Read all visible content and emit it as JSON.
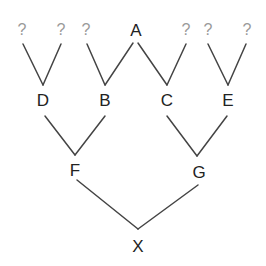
{
  "diagram": {
    "type": "genealogy-tree",
    "nodes": {
      "A": {
        "label": "A",
        "x": 136,
        "y": 36
      },
      "B": {
        "label": "B",
        "x": 105,
        "y": 106
      },
      "C": {
        "label": "C",
        "x": 167,
        "y": 106
      },
      "D": {
        "label": "D",
        "x": 43,
        "y": 106
      },
      "E": {
        "label": "E",
        "x": 228,
        "y": 106
      },
      "F": {
        "label": "F",
        "x": 75,
        "y": 176
      },
      "G": {
        "label": "G",
        "x": 199,
        "y": 178
      },
      "X": {
        "label": "X",
        "x": 138,
        "y": 252
      }
    },
    "unknowns": [
      {
        "label": "?",
        "x": 22,
        "y": 35
      },
      {
        "label": "?",
        "x": 61,
        "y": 35
      },
      {
        "label": "?",
        "x": 86,
        "y": 35
      },
      {
        "label": "?",
        "x": 186,
        "y": 35
      },
      {
        "label": "?",
        "x": 208,
        "y": 35
      },
      {
        "label": "?",
        "x": 247,
        "y": 35
      }
    ],
    "edges": [
      {
        "from": "?1",
        "to": "D"
      },
      {
        "from": "?2",
        "to": "D"
      },
      {
        "from": "?3",
        "to": "B"
      },
      {
        "from": "A",
        "to": "B"
      },
      {
        "from": "A",
        "to": "C"
      },
      {
        "from": "?4",
        "to": "C"
      },
      {
        "from": "?5",
        "to": "E"
      },
      {
        "from": "?6",
        "to": "E"
      },
      {
        "from": "D",
        "to": "F"
      },
      {
        "from": "B",
        "to": "F"
      },
      {
        "from": "C",
        "to": "G"
      },
      {
        "from": "E",
        "to": "G"
      },
      {
        "from": "F",
        "to": "X"
      },
      {
        "from": "G",
        "to": "X"
      }
    ],
    "colors": {
      "edge": "#444444",
      "node_text": "#222222",
      "unknown_text": "#9a9a9a"
    }
  }
}
